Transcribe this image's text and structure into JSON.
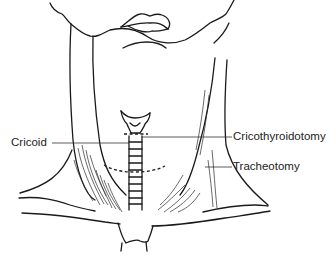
{
  "diagram": {
    "labels": {
      "cricoid": "Cricoid",
      "cricothyroidotomy": "Cricothyroidotomy",
      "tracheotomy": "Tracheotomy"
    },
    "colors": {
      "line": "#1a1a1a",
      "text": "#222222",
      "background": "#ffffff"
    }
  }
}
